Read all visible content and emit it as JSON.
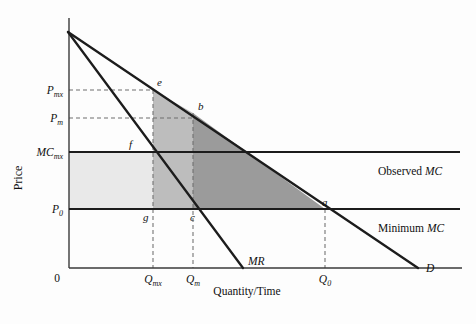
{
  "figure": {
    "type": "economics-diagram",
    "title_visible": "",
    "background_color": "#fdfdfd"
  },
  "axes": {
    "y_title": "Price",
    "x_title": "Quantity/Time",
    "origin_label": "0",
    "y_ticks": [
      {
        "id": "p_mx",
        "base": "P",
        "sub": "mx",
        "y_px": 90
      },
      {
        "id": "p_m",
        "base": "P",
        "sub": "m",
        "y_px": 118
      },
      {
        "id": "mc_mx",
        "base": "MC",
        "sub": "mx",
        "y_px": 152
      },
      {
        "id": "p_0",
        "base": "P",
        "sub": "0",
        "y_px": 209
      }
    ],
    "x_ticks": [
      {
        "id": "q_mx",
        "base": "Q",
        "sub": "mx",
        "x_px": 153
      },
      {
        "id": "q_m",
        "base": "Q",
        "sub": "m",
        "x_px": 193
      },
      {
        "id": "q_0",
        "base": "Q",
        "sub": "0",
        "x_px": 325
      }
    ]
  },
  "curves": [
    {
      "id": "demand",
      "label": "D",
      "label_x": 426,
      "label_y": 272,
      "x1": 68,
      "y1": 32,
      "x2": 418,
      "y2": 268
    },
    {
      "id": "marginal_revenue",
      "label": "MR",
      "label_x": 248,
      "label_y": 265,
      "x1": 68,
      "y1": 32,
      "x2": 243,
      "y2": 268
    }
  ],
  "cost_lines": [
    {
      "id": "observed_mc",
      "label_prefix": "Observed ",
      "label_italic": "MC",
      "label_x": 378,
      "label_y": 175,
      "y_px": 152
    },
    {
      "id": "minimum_mc",
      "label_prefix": "Minimum ",
      "label_italic": "MC",
      "label_x": 378,
      "label_y": 232,
      "y_px": 209
    }
  ],
  "points": [
    {
      "id": "e",
      "label": "e",
      "x_px": 153,
      "y_px": 90,
      "label_dx": 4,
      "label_dy": -4
    },
    {
      "id": "b",
      "label": "b",
      "x_px": 193,
      "y_px": 113,
      "label_dx": 5,
      "label_dy": -3
    },
    {
      "id": "f",
      "label": "f",
      "x_px": 131,
      "y_px": 152,
      "label_dx": -2,
      "label_dy": -4
    },
    {
      "id": "g",
      "label": "g",
      "x_px": 153,
      "y_px": 209,
      "label_dx": -10,
      "label_dy": 12
    },
    {
      "id": "c",
      "label": "c",
      "x_px": 193,
      "y_px": 209,
      "label_dx": -3,
      "label_dy": 12
    },
    {
      "id": "a",
      "label": "a",
      "x_px": 325,
      "y_px": 209,
      "label_dx": -3,
      "label_dy": -3
    }
  ],
  "shaded_regions": [
    {
      "id": "light-region",
      "description": "P0-MCmx rectangle left of Qmx",
      "color": "#e9e9e9",
      "polygon": "69,152 153,152 153,209 69,209"
    },
    {
      "id": "medium-region-upper",
      "description": "e-b-c-g medium shaded block under demand from Qmx to Qm",
      "color": "#bdbdbd",
      "polygon": "153,90 193,113 193,209 153,209"
    },
    {
      "id": "dark-region",
      "description": "b-a triangle from Qm to Q0 under demand above minimum MC",
      "color": "#9b9b9b",
      "polygon": "193,113 325,209 193,209"
    }
  ],
  "dashed_guides": [
    {
      "id": "guide-pmx",
      "x1": 69,
      "y1": 90,
      "x2": 153,
      "y2": 90
    },
    {
      "id": "guide-pm",
      "x1": 69,
      "y1": 118,
      "x2": 193,
      "y2": 118
    },
    {
      "id": "guide-qmx",
      "x1": 153,
      "y1": 90,
      "x2": 153,
      "y2": 268
    },
    {
      "id": "guide-qm",
      "x1": 193,
      "y1": 113,
      "x2": 193,
      "y2": 268
    },
    {
      "id": "guide-q0",
      "x1": 325,
      "y1": 209,
      "x2": 325,
      "y2": 268
    }
  ],
  "geometry": {
    "y_axis_x": 69,
    "x_axis_y": 268,
    "y_axis_top": 18,
    "x_axis_right": 462
  }
}
